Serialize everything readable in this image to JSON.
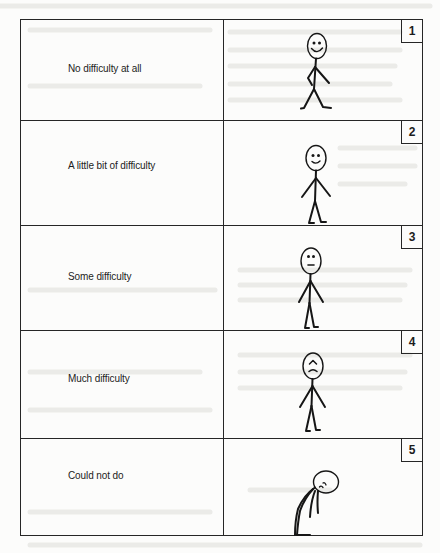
{
  "document": {
    "type": "difficulty-rating-scale",
    "rows": [
      {
        "number": "1",
        "label": "No difficulty at all",
        "figure": "standing-smiling-figure"
      },
      {
        "number": "2",
        "label": "A little bit of difficulty",
        "figure": "standing-slight-smile-figure"
      },
      {
        "number": "3",
        "label": "Some difficulty",
        "figure": "standing-neutral-figure"
      },
      {
        "number": "4",
        "label": "Much difficulty",
        "figure": "standing-frowning-figure"
      },
      {
        "number": "5",
        "label": "Could not do",
        "figure": "slumped-over-figure"
      }
    ]
  },
  "colors": {
    "paper": "#fcfcfb",
    "ink": "#161616",
    "bleed_through": "#e6e6e4"
  }
}
